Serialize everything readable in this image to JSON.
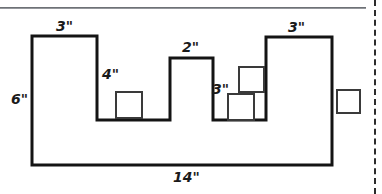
{
  "figure": {
    "title_text": "",
    "shape_name": "crenellated-polygon",
    "stroke_color": "#141414",
    "square_stroke_color": "#3a3a3a",
    "background_color": "#ffffff",
    "divider_color": "#6e7176",
    "dashed_line_color": "#2b2b2b"
  },
  "labels": {
    "left_height": "6\"",
    "tower_left_width": "3\"",
    "notch_left_depth": "4\"",
    "tower_middle_width": "2\"",
    "notch_right_depth": "3\"",
    "tower_right_width": "3\"",
    "bottom_width": "14\""
  },
  "chart_data": {
    "type": "diagram",
    "title": "",
    "xlabel": "",
    "ylabel": "",
    "dimensions": [
      {
        "name": "left_height",
        "value": 6,
        "unit": "in",
        "label": "6\""
      },
      {
        "name": "tower_left_width",
        "value": 3,
        "unit": "in",
        "label": "3\""
      },
      {
        "name": "notch_left_depth",
        "value": 4,
        "unit": "in",
        "label": "4\""
      },
      {
        "name": "tower_middle_width",
        "value": 2,
        "unit": "in",
        "label": "2\""
      },
      {
        "name": "notch_right_depth",
        "value": 3,
        "unit": "in",
        "label": "3\""
      },
      {
        "name": "tower_right_width",
        "value": 3,
        "unit": "in",
        "label": "3\""
      },
      {
        "name": "bottom_width",
        "value": 14,
        "unit": "in",
        "label": "14\""
      }
    ],
    "outline_points": "32,36 97,36 97,120 170,120 170,58 213,58 213,120 266,120 266,37 332,37 332,165 32,165 32,36",
    "squares": [
      {
        "name": "square-notch-left",
        "x": 116,
        "y": 92,
        "size": 26
      },
      {
        "name": "square-notch-right-upper",
        "x": 239,
        "y": 67,
        "size": 25
      },
      {
        "name": "square-notch-right-lower",
        "x": 228,
        "y": 94,
        "size": 26
      },
      {
        "name": "square-outside-right",
        "x": 337,
        "y": 90,
        "size": 23
      }
    ]
  }
}
